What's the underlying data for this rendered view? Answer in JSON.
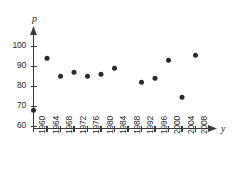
{
  "chart_data": {
    "type": "scatter",
    "title": "",
    "xlabel": "y",
    "ylabel": "p",
    "xlim": [
      1958,
      2012
    ],
    "ylim": [
      60,
      104
    ],
    "grid": false,
    "legend": null,
    "x_tick_labels": [
      "1960",
      "1964",
      "1968",
      "1972",
      "1976",
      "1980",
      "1984",
      "1988",
      "1992",
      "1996",
      "2000",
      "2004",
      "2008"
    ],
    "y_tick_labels": [
      "60",
      "70",
      "80",
      "90",
      "100"
    ],
    "y_ticks": [
      60,
      70,
      80,
      90,
      100
    ],
    "x_ticks": [
      1960,
      1964,
      1968,
      1972,
      1976,
      1980,
      1984,
      1988,
      1992,
      1996,
      2000,
      2004,
      2008
    ],
    "points": [
      {
        "x": 1960,
        "y": 68
      },
      {
        "x": 1964,
        "y": 94
      },
      {
        "x": 1968,
        "y": 85
      },
      {
        "x": 1972,
        "y": 87
      },
      {
        "x": 1976,
        "y": 85
      },
      {
        "x": 1980,
        "y": 86
      },
      {
        "x": 1984,
        "y": 89
      },
      {
        "x": 1992,
        "y": 82
      },
      {
        "x": 1996,
        "y": 84
      },
      {
        "x": 2000,
        "y": 93
      },
      {
        "x": 2004,
        "y": 74.5
      },
      {
        "x": 2008,
        "y": 95.5
      }
    ],
    "colors": {
      "marker": "#2b2b2b",
      "axis": "#3a3a3a",
      "text": "#2b2b2b",
      "background": "#ffffff"
    }
  }
}
